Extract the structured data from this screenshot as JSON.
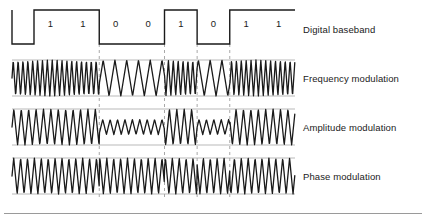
{
  "figure": {
    "background": "#ffffff",
    "width": 426,
    "height": 219,
    "stroke_color": "#1a1a1a",
    "rail_color": "#b9b9b9",
    "grid_color": "#a8a8a8",
    "text_color": "#1a1a1a",
    "bottom_rule_color": "#9a9a9a"
  },
  "rows": [
    {
      "key": "baseband",
      "label": "Digital baseband",
      "type": "square",
      "top": 10,
      "bottom": 44
    },
    {
      "key": "fm",
      "label": "Frequency modulation",
      "type": "frequency",
      "top": 60,
      "bottom": 96
    },
    {
      "key": "am",
      "label": "Amplitude modulation",
      "type": "amplitude",
      "top": 109,
      "bottom": 145
    },
    {
      "key": "pm",
      "label": "Phase modulation",
      "type": "phase",
      "top": 158,
      "bottom": 194
    }
  ],
  "signal": {
    "bits": [
      "1",
      "1",
      "0",
      "0",
      "1",
      "0",
      "1",
      "1"
    ],
    "bit_count": 8,
    "plot_left": 12,
    "plot_right": 295,
    "lead_in": 22,
    "boundary_gridlines_at_bits": [
      2,
      4,
      5,
      6
    ]
  },
  "chart_data": {
    "type": "line",
    "categories": [
      "1",
      "1",
      "0",
      "0",
      "1",
      "0",
      "1",
      "1"
    ],
    "series": [
      {
        "name": "Digital baseband",
        "values": [
          1,
          1,
          0,
          0,
          1,
          0,
          1,
          1
        ]
      },
      {
        "name": "Frequency modulation",
        "values": [
          1,
          1,
          0,
          0,
          1,
          0,
          1,
          1
        ]
      },
      {
        "name": "Amplitude modulation",
        "values": [
          1,
          1,
          0,
          0,
          1,
          0,
          1,
          1
        ]
      },
      {
        "name": "Phase modulation",
        "values": [
          1,
          1,
          0,
          0,
          1,
          0,
          1,
          1
        ]
      }
    ],
    "xlabel": "",
    "ylabel": "",
    "grid": true,
    "legend_position": "right"
  }
}
